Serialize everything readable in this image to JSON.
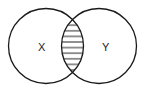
{
  "diagram": {
    "type": "venn",
    "sets": [
      {
        "label": "X",
        "cx": 46,
        "cy": 46,
        "r": 37.5
      },
      {
        "label": "Y",
        "cx": 99,
        "cy": 46,
        "r": 37.5
      }
    ],
    "shaded_region": "X ∩ Y",
    "shading": "horizontal-hatch",
    "colors": {
      "stroke": "#1a1a1a",
      "background": "#ffffff"
    }
  }
}
